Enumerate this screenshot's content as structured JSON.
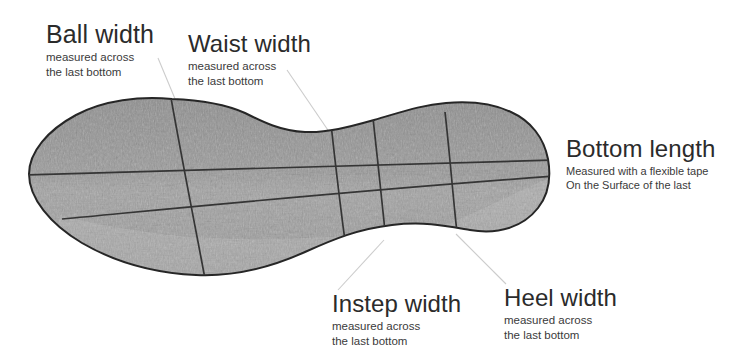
{
  "figure": {
    "kind": "technical-diagram",
    "background_color": "#ffffff",
    "sole_fill_color": "#9a9a9a",
    "sole_outline_color": "#2a2a2a",
    "measurement_line_color": "#3a3a3a",
    "leader_line_color": "#c9c9c9",
    "title_text_color": "#2b2b2b",
    "sub_text_color": "#3a3a3a"
  },
  "callouts": [
    {
      "id": "ball-width",
      "title": "Ball width",
      "sub_line1": "measured across",
      "sub_line2": "the last bottom"
    },
    {
      "id": "waist-width",
      "title": "Waist width",
      "sub_line1": "measured across",
      "sub_line2": "the last bottom"
    },
    {
      "id": "bottom-length",
      "title": "Bottom length",
      "sub_line1": "Measured with a flexible tape",
      "sub_line2": "On the Surface of the last"
    },
    {
      "id": "instep-width",
      "title": "Instep width",
      "sub_line1": "measured across",
      "sub_line2": "the last bottom"
    },
    {
      "id": "heel-width",
      "title": "Heel width",
      "sub_line1": "measured across",
      "sub_line2": "the last bottom"
    }
  ],
  "measurement_lines": [
    {
      "name": "bottom-length-line",
      "orientation": "longitudinal",
      "from": [
        30,
        173
      ],
      "to": [
        549,
        161
      ]
    },
    {
      "name": "ball-width-line",
      "orientation": "transverse",
      "from": [
        172,
        100
      ],
      "to": [
        205,
        273
      ]
    },
    {
      "name": "waist-width-line",
      "orientation": "transverse",
      "from": [
        333,
        134
      ],
      "to": [
        346,
        246
      ]
    },
    {
      "name": "instep-width-line",
      "orientation": "transverse",
      "from": [
        375,
        128
      ],
      "to": [
        386,
        240
      ]
    },
    {
      "name": "heel-width-line",
      "orientation": "transverse",
      "from": [
        447,
        120
      ],
      "to": [
        457,
        233
      ]
    },
    {
      "name": "diagonal-edge-line",
      "orientation": "diagonal",
      "from": [
        67,
        217
      ],
      "to": [
        549,
        175
      ]
    }
  ],
  "leader_lines": [
    {
      "name": "ball-width-leader",
      "from": [
        158,
        58
      ],
      "to": [
        177,
        104
      ]
    },
    {
      "name": "waist-width-leader",
      "from": [
        287,
        70
      ],
      "to": [
        334,
        137
      ]
    },
    {
      "name": "instep-width-leader",
      "from": [
        383,
        241
      ],
      "to": [
        337,
        289
      ]
    },
    {
      "name": "heel-width-leader",
      "from": [
        455,
        236
      ],
      "to": [
        505,
        285
      ]
    }
  ]
}
